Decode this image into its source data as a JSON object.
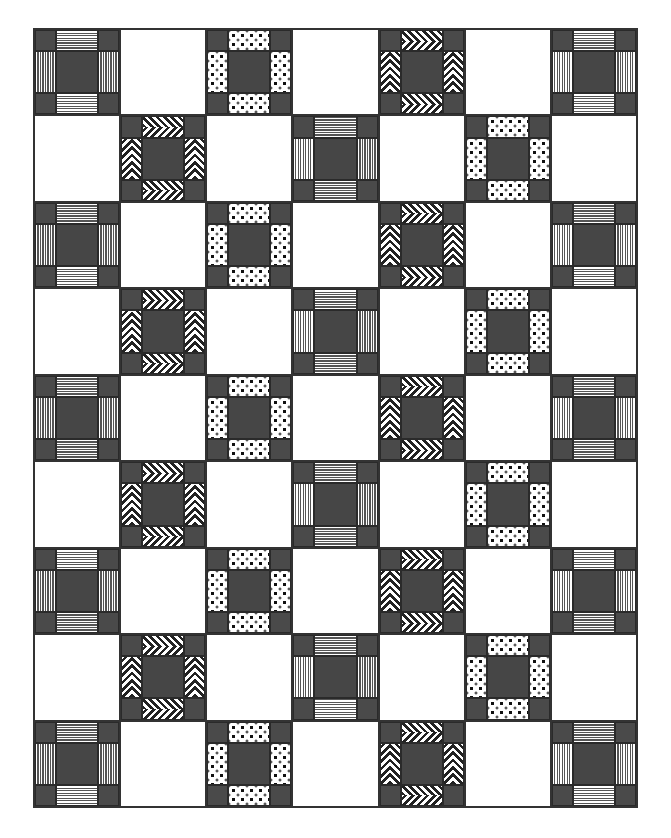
{
  "title": "",
  "quilt": {
    "columns": 7,
    "rows": 9,
    "colors": {
      "dark_fill": "#4a4a4a",
      "center_fill": "#464646",
      "background": "#ffffff",
      "line": "#333333"
    },
    "block_types": {
      "stripes": "nine-patch block with striped bars (horizontal top/bottom, vertical sides)",
      "dots": "nine-patch block with polka-dot bars",
      "chevron": "nine-patch block with chevron-striped bars",
      "plain": "plain white square"
    },
    "row_patterns": {
      "odd": [
        "stripes",
        "plain",
        "dots",
        "plain",
        "chevron",
        "plain",
        "stripes"
      ],
      "even": [
        "plain",
        "chevron",
        "plain",
        "stripes",
        "plain",
        "dots",
        "plain"
      ]
    },
    "grid": [
      [
        "stripes",
        "plain",
        "dots",
        "plain",
        "chevron",
        "plain",
        "stripes"
      ],
      [
        "plain",
        "chevron",
        "plain",
        "stripes",
        "plain",
        "dots",
        "plain"
      ],
      [
        "stripes",
        "plain",
        "dots",
        "plain",
        "chevron",
        "plain",
        "stripes"
      ],
      [
        "plain",
        "chevron",
        "plain",
        "stripes",
        "plain",
        "dots",
        "plain"
      ],
      [
        "stripes",
        "plain",
        "dots",
        "plain",
        "chevron",
        "plain",
        "stripes"
      ],
      [
        "plain",
        "chevron",
        "plain",
        "stripes",
        "plain",
        "dots",
        "plain"
      ],
      [
        "stripes",
        "plain",
        "dots",
        "plain",
        "chevron",
        "plain",
        "stripes"
      ],
      [
        "plain",
        "chevron",
        "plain",
        "stripes",
        "plain",
        "dots",
        "plain"
      ],
      [
        "stripes",
        "plain",
        "dots",
        "plain",
        "chevron",
        "plain",
        "stripes"
      ]
    ]
  }
}
